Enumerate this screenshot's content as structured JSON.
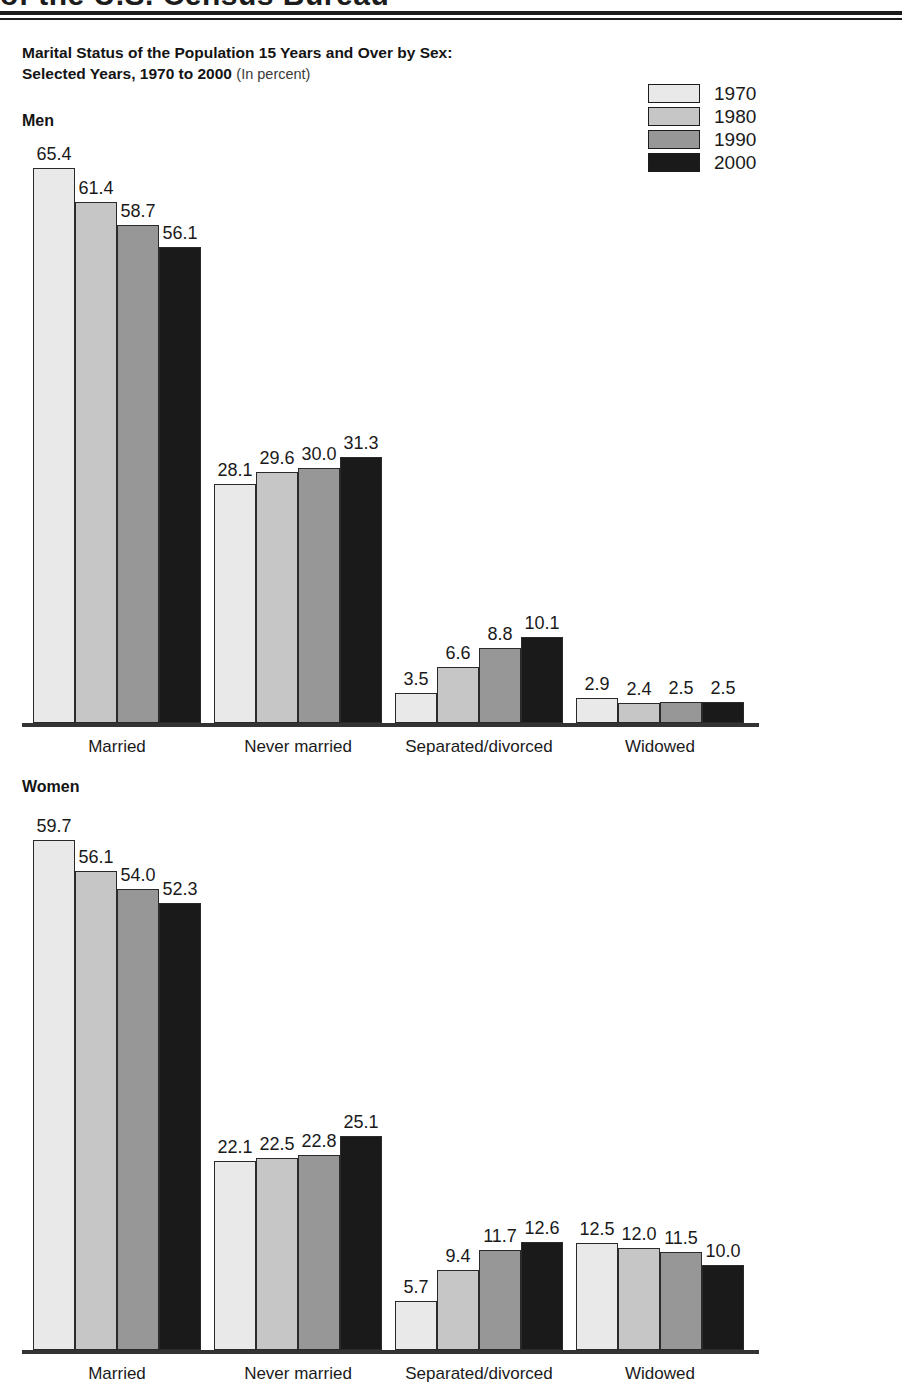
{
  "masthead": {
    "text": "of the U.S. Census Bureau"
  },
  "title": {
    "line1": "Marital Status of the Population 15 Years and Over by Sex:",
    "line2": "Selected Years, 1970 to 2000",
    "note": "(In percent)"
  },
  "legend": {
    "entries": [
      {
        "label": "1970",
        "color": "#e9e9e9"
      },
      {
        "label": "1980",
        "color": "#c6c6c6"
      },
      {
        "label": "1990",
        "color": "#979797"
      },
      {
        "label": "2000",
        "color": "#1a1a1a"
      }
    ]
  },
  "panels": [
    {
      "heading": "Men"
    },
    {
      "heading": "Women"
    }
  ],
  "chart_data": [
    {
      "type": "bar",
      "title": "Marital Status of the Population 15 Years and Over by Sex: Selected Years, 1970 to 2000 (In percent)",
      "subtitle": "Men",
      "xlabel": "",
      "ylabel": "Percent",
      "ylim": [
        0,
        70
      ],
      "grid": false,
      "legend_position": "top-right",
      "categories": [
        "Married",
        "Never married",
        "Separated/divorced",
        "Widowed"
      ],
      "series": [
        {
          "name": "1970",
          "color": "#e9e9e9",
          "values": [
            65.4,
            28.1,
            3.5,
            2.9
          ]
        },
        {
          "name": "1980",
          "color": "#c6c6c6",
          "values": [
            61.4,
            29.6,
            6.6,
            2.4
          ]
        },
        {
          "name": "1990",
          "color": "#979797",
          "values": [
            58.7,
            30.0,
            8.8,
            2.5
          ]
        },
        {
          "name": "2000",
          "color": "#1a1a1a",
          "values": [
            56.1,
            31.3,
            10.1,
            2.5
          ]
        }
      ]
    },
    {
      "type": "bar",
      "title": "Marital Status of the Population 15 Years and Over by Sex: Selected Years, 1970 to 2000 (In percent)",
      "subtitle": "Women",
      "xlabel": "",
      "ylabel": "Percent",
      "ylim": [
        0,
        70
      ],
      "grid": false,
      "legend_position": "top-right",
      "categories": [
        "Married",
        "Never married",
        "Separated/divorced",
        "Widowed"
      ],
      "series": [
        {
          "name": "1970",
          "color": "#e9e9e9",
          "values": [
            59.7,
            22.1,
            5.7,
            12.5
          ]
        },
        {
          "name": "1980",
          "color": "#c6c6c6",
          "values": [
            56.1,
            22.5,
            9.4,
            12.0
          ]
        },
        {
          "name": "1990",
          "color": "#979797",
          "values": [
            54.0,
            22.8,
            11.7,
            11.5
          ]
        },
        {
          "name": "2000",
          "color": "#1a1a1a",
          "values": [
            52.3,
            25.1,
            12.6,
            10.0
          ]
        }
      ]
    }
  ]
}
